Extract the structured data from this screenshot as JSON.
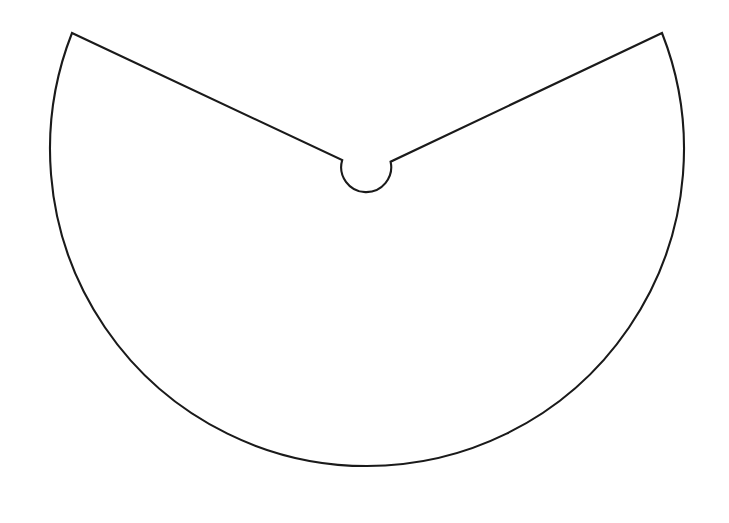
{
  "document": {
    "title": "Geometric Sector Diagram",
    "kind": "line-drawing",
    "background_color": "#ffffff",
    "canvas": {
      "width": 729,
      "height": 523
    }
  },
  "figure": {
    "name": "slotted-circular-sector",
    "stroke_color": "#1a1a1a",
    "stroke_width": 2.1,
    "fill": "none",
    "geometry": {
      "outer_arc": {
        "type": "arc",
        "center": {
          "x": 366,
          "y": 180
        },
        "radius": 317,
        "start_point": {
          "x": 72,
          "y": 33
        },
        "end_point": {
          "x": 662,
          "y": 33
        },
        "sweep_degrees": 245,
        "bottom_point": {
          "x": 366,
          "y": 497
        },
        "leftmost_point": {
          "x": 49,
          "y": 180
        },
        "rightmost_point": {
          "x": 683,
          "y": 180
        }
      },
      "inner_circle": {
        "type": "arc",
        "center": {
          "x": 366,
          "y": 180
        },
        "radius": 25,
        "start_point": {
          "x": 342,
          "y": 160
        },
        "end_point": {
          "x": 391,
          "y": 162
        },
        "bottom_point": {
          "x": 366,
          "y": 205
        },
        "sweep_degrees": 295
      },
      "left_edge": {
        "type": "line",
        "from": {
          "x": 72,
          "y": 33
        },
        "to": {
          "x": 342,
          "y": 160
        }
      },
      "right_edge": {
        "type": "line",
        "from": {
          "x": 662,
          "y": 33
        },
        "to": {
          "x": 391,
          "y": 162
        }
      }
    },
    "path_d": "M 72 33 L 342.2 160.1 A 25 25 0 1 0 390.6 161.7 L 662 33 A 317 317 0 1 1 72 33 Z"
  }
}
